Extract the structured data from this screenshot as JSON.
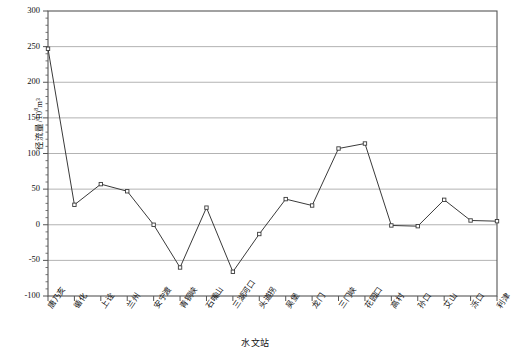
{
  "chart_data": {
    "type": "line",
    "title": "",
    "xlabel": "水文站",
    "ylabel": "径流量/10⁸m³",
    "ylabel_base": "径流量/10",
    "ylabel_sup": "8",
    "ylabel_tail": "m³",
    "ylim": [
      -100,
      300
    ],
    "ytick_values": [
      300,
      250,
      200,
      150,
      100,
      50,
      0,
      -50,
      -100
    ],
    "ytick_labels": [
      "300",
      "250",
      "200",
      "150",
      "100",
      "50",
      "0",
      "-50",
      "-100"
    ],
    "yminor_step": 10,
    "grid": "horizontal-major",
    "legend": "none",
    "marker": "open-square",
    "line_color": "#3a3a3a",
    "grid_color": "#aaaaaa",
    "axis_color": "#555555",
    "categories": [
      "唐乃亥",
      "循化",
      "上诠",
      "兰州",
      "安宁渡",
      "青铜峡",
      "石嘴山",
      "三湖河口",
      "头道拐",
      "吴堡",
      "龙门",
      "三门峡",
      "花园口",
      "高村",
      "孙口",
      "艾山",
      "泺口",
      "利津"
    ],
    "values": [
      247,
      28,
      57,
      47,
      0,
      -60,
      24,
      -66,
      -13,
      36,
      27,
      107,
      114,
      -1,
      -2,
      35,
      6,
      5
    ]
  }
}
